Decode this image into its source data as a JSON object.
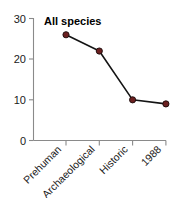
{
  "chart_data": {
    "type": "line",
    "title": "All species",
    "xlabel": "",
    "ylabel": "",
    "categories": [
      "Prehuman",
      "Archaeological",
      "Historic",
      "1988"
    ],
    "values": [
      26,
      22,
      10,
      9
    ],
    "series": [
      {
        "name": "All species",
        "values": [
          26,
          22,
          10,
          9
        ]
      }
    ],
    "ylim": [
      0,
      30
    ],
    "yticks": [
      0,
      10,
      20,
      30
    ],
    "ytick_labels": [
      "0",
      "10",
      "20",
      "30"
    ],
    "grid": false,
    "legend": false,
    "legend_position": "none",
    "marker": "circle",
    "marker_color": "#6B2020",
    "marker_edge_color": "#1a0a0a",
    "line_color": "#141414",
    "axis_color": "#8a8a8a",
    "background_color": "#ffffff",
    "xtick_label_rotation": 45,
    "annotations": []
  },
  "axis": {
    "y_tick_0": "0",
    "y_tick_1": "10",
    "y_tick_2": "20",
    "y_tick_3": "30"
  },
  "x_labels": {
    "cat0": "Prehuman",
    "cat1": "Archaeological",
    "cat2": "Historic",
    "cat3": "1988"
  },
  "title": {
    "text": "All species"
  }
}
